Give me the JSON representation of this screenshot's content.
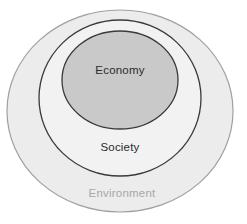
{
  "diagram": {
    "type": "nested-ellipses",
    "background_color": "#ffffff",
    "rings": [
      {
        "id": "environment",
        "label": "Environment",
        "level": 1,
        "position": "outermost",
        "fill_color": "#ececec",
        "stroke_color": "#a0a0a0",
        "label_color": "#a8a8a8",
        "label_position": "bottom",
        "center_x": 120,
        "center_y": 111,
        "radius_x": 113,
        "radius_y": 101
      },
      {
        "id": "society",
        "label": "Society",
        "level": 2,
        "position": "middle",
        "fill_color": "#f2f2f2",
        "stroke_color": "#3a3a3a",
        "label_color": "#2b2b2b",
        "label_position": "bottom",
        "center_x": 120,
        "center_y": 98,
        "radius_x": 81,
        "radius_y": 78
      },
      {
        "id": "economy",
        "label": "Economy",
        "level": 3,
        "position": "innermost",
        "fill_color": "#c9c9c9",
        "stroke_color": "#3a3a3a",
        "label_color": "#2b2b2b",
        "label_position": "center",
        "center_x": 120,
        "center_y": 80,
        "radius_x": 58,
        "radius_y": 49
      }
    ],
    "labels": {
      "economy": "Economy",
      "society": "Society",
      "environment": "Environment"
    }
  }
}
